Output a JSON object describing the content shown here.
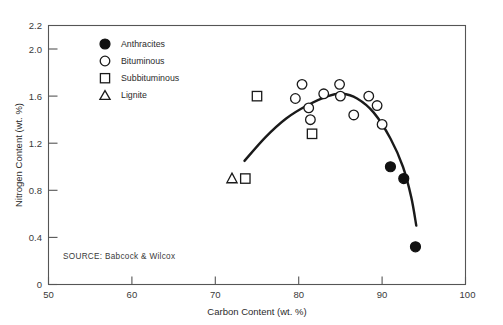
{
  "chart_data": {
    "type": "scatter",
    "title": "",
    "xlabel": "Carbon Content (wt. %)",
    "ylabel": "Nitrogen Content (wt. %)",
    "xlim": [
      50,
      100
    ],
    "ylim": [
      0,
      2.2
    ],
    "xticks": [
      "50",
      "60",
      "70",
      "80",
      "90",
      "100"
    ],
    "yticks": [
      "0",
      "0.4",
      "0.8",
      "1.2",
      "1.6",
      "2.0",
      "2.2"
    ],
    "grid": false,
    "legend_position": "upper-left inside plot",
    "source": "SOURCE:  Babcock & Wilcox",
    "series": [
      {
        "name": "Anthracites",
        "marker": "filled-circle",
        "points": [
          {
            "x": 91.0,
            "y": 1.0
          },
          {
            "x": 92.6,
            "y": 0.9
          },
          {
            "x": 94.0,
            "y": 0.32
          }
        ]
      },
      {
        "name": "Bituminous",
        "marker": "open-circle",
        "points": [
          {
            "x": 79.6,
            "y": 1.58
          },
          {
            "x": 80.4,
            "y": 1.7
          },
          {
            "x": 81.2,
            "y": 1.5
          },
          {
            "x": 81.4,
            "y": 1.4
          },
          {
            "x": 83.0,
            "y": 1.62
          },
          {
            "x": 84.9,
            "y": 1.7
          },
          {
            "x": 85.0,
            "y": 1.6
          },
          {
            "x": 86.6,
            "y": 1.44
          },
          {
            "x": 88.4,
            "y": 1.6
          },
          {
            "x": 89.4,
            "y": 1.52
          },
          {
            "x": 90.0,
            "y": 1.36
          }
        ]
      },
      {
        "name": "Subbituminous",
        "marker": "open-square",
        "points": [
          {
            "x": 73.6,
            "y": 0.9
          },
          {
            "x": 75.0,
            "y": 1.6
          },
          {
            "x": 81.6,
            "y": 1.28
          }
        ]
      },
      {
        "name": "Lignite",
        "marker": "open-triangle",
        "points": [
          {
            "x": 72.0,
            "y": 0.9
          }
        ]
      }
    ],
    "fit_curve": {
      "name": "trend curve",
      "points": [
        {
          "x": 73.5,
          "y": 1.05
        },
        {
          "x": 76.0,
          "y": 1.25
        },
        {
          "x": 78.5,
          "y": 1.41
        },
        {
          "x": 81.0,
          "y": 1.52
        },
        {
          "x": 83.5,
          "y": 1.6
        },
        {
          "x": 85.2,
          "y": 1.62
        },
        {
          "x": 87.0,
          "y": 1.58
        },
        {
          "x": 89.0,
          "y": 1.46
        },
        {
          "x": 91.0,
          "y": 1.24
        },
        {
          "x": 92.5,
          "y": 1.0
        },
        {
          "x": 93.5,
          "y": 0.74
        },
        {
          "x": 94.1,
          "y": 0.5
        }
      ]
    }
  },
  "legend": {
    "items": [
      {
        "label": "Anthracites",
        "marker": "filled-circle"
      },
      {
        "label": "Bituminous",
        "marker": "open-circle"
      },
      {
        "label": "Subbituminous",
        "marker": "open-square"
      },
      {
        "label": "Lignite",
        "marker": "open-triangle"
      }
    ]
  }
}
